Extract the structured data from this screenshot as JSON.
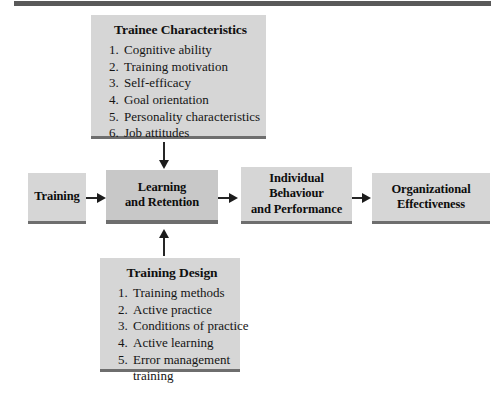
{
  "diagram": {
    "title_rule": "top-divider",
    "colors": {
      "box_fill": "#d4d4d4",
      "box_fill_emphasis": "#c8c8c8",
      "box_shadow": "#6e6e6e",
      "rule": "#595959",
      "connector": "#262626",
      "text": "#101010"
    },
    "boxes": {
      "trainee_characteristics": {
        "header": "Trainee Characteristics",
        "items": [
          "Cognitive ability",
          "Training motivation",
          "Self-efficacy",
          "Goal orientation",
          "Personality characteristics",
          "Job attitudes"
        ]
      },
      "training": {
        "lines": [
          "Training"
        ]
      },
      "learning_retention": {
        "lines": [
          "Learning",
          "and Retention"
        ]
      },
      "individual_behaviour": {
        "lines": [
          "Individual",
          "Behaviour",
          "and Performance"
        ]
      },
      "organizational_effectiveness": {
        "lines": [
          "Organizational",
          "Effectiveness"
        ]
      },
      "training_design": {
        "header": "Training Design",
        "items": [
          "Training methods",
          "Active practice",
          "Conditions of practice",
          "Active learning",
          "Error management"
        ],
        "item5_continuation": "training"
      }
    },
    "connectors": [
      {
        "name": "trainee-to-learning",
        "direction": "down"
      },
      {
        "name": "design-to-learning",
        "direction": "up"
      },
      {
        "name": "training-to-learning",
        "direction": "right"
      },
      {
        "name": "learning-to-individual",
        "direction": "right"
      },
      {
        "name": "individual-to-organizational",
        "direction": "right"
      }
    ]
  }
}
